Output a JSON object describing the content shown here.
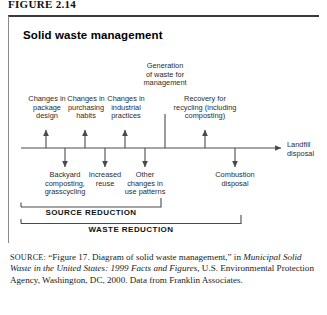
{
  "figure": {
    "number_label": "FIGURE 2.14",
    "title": "Solid waste management"
  },
  "diagram": {
    "generation_label": "Generation\nof waste for\nmanagement",
    "upper_branches": [
      {
        "name": "package-design",
        "label": "Changes in\npackage\ndesign"
      },
      {
        "name": "purchasing-habits",
        "label": "Changes in\npurchasing\nhabits"
      },
      {
        "name": "industrial-practices",
        "label": "Changes in\nindustrial\npractices"
      },
      {
        "name": "recovery-recycling",
        "label": "Recovery for\nrecycling (including\ncomposting)"
      }
    ],
    "lower_branches": [
      {
        "name": "backyard-composting",
        "label": "Backyard\ncomposting,\ngrasscycling"
      },
      {
        "name": "increased-reuse",
        "label": "Increased\nreuse"
      },
      {
        "name": "use-patterns",
        "label": "Other\nchanges in\nuse patterns"
      },
      {
        "name": "combustion-disposal",
        "label": "Combustion\ndisposal"
      }
    ],
    "axis_end_label": "Landfill\ndisposal",
    "brackets": [
      {
        "name": "source-reduction",
        "label": "SOURCE REDUCTION"
      },
      {
        "name": "waste-reduction",
        "label": "WASTE REDUCTION"
      }
    ]
  },
  "source_note": {
    "prefix": "SOURCE:",
    "quoted_title": "“Figure 17. Diagram of solid waste management,” in",
    "publication": "Municipal Solid Waste in the United States: 1999 Facts and Figures,",
    "rest": "U.S. Environmental Protection Agency, Washington, DC, 2000. Data from Franklin Associates."
  },
  "colors": {
    "rule": "#3a3a3a",
    "line": "#4a4a4a",
    "text": "#2b2b2b"
  }
}
